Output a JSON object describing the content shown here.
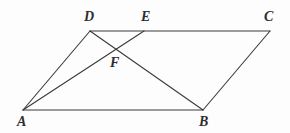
{
  "figure": {
    "kind": "geometry-diagram",
    "background_color": "#fdfdfd",
    "line_color": "#3a3a3a",
    "label_color": "#2e2e2e",
    "line_width": 1.1,
    "width": 290,
    "height": 133,
    "points": [
      {
        "id": "A",
        "label": "A",
        "x": 23,
        "y": 110,
        "label_x": 17,
        "label_y": 115
      },
      {
        "id": "B",
        "label": "B",
        "x": 203,
        "y": 110,
        "label_x": 199,
        "label_y": 115
      },
      {
        "id": "C",
        "label": "C",
        "x": 270,
        "y": 31,
        "label_x": 264,
        "label_y": 10
      },
      {
        "id": "D",
        "label": "D",
        "x": 90,
        "y": 31,
        "label_x": 84,
        "label_y": 10
      },
      {
        "id": "E",
        "label": "E",
        "x": 144,
        "y": 31,
        "label_x": 141,
        "label_y": 10
      },
      {
        "id": "F",
        "label": "F",
        "x": 117,
        "y": 48,
        "label_x": 110,
        "label_y": 56
      }
    ],
    "segments": [
      {
        "id": "AB",
        "from": "A",
        "to": "B",
        "name": "segment-ab"
      },
      {
        "id": "DC",
        "from": "D",
        "to": "C",
        "name": "segment-dc"
      },
      {
        "id": "AD",
        "from": "A",
        "to": "D",
        "name": "segment-ad"
      },
      {
        "id": "BC",
        "from": "B",
        "to": "C",
        "name": "segment-bc"
      },
      {
        "id": "AE",
        "from": "A",
        "to": "E",
        "name": "segment-ae"
      },
      {
        "id": "DB",
        "from": "D",
        "to": "B",
        "name": "segment-db"
      }
    ]
  }
}
